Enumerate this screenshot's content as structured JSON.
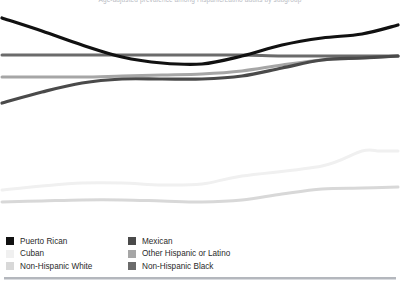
{
  "header": {
    "title_clipped": "Age-adjusted prevalence among Hispanic/Latino adults by subgroup"
  },
  "legend": {
    "columns": [
      {
        "items": [
          {
            "label": "Puerto Rican",
            "color": "#111111",
            "swatch_name": "legend-swatch-puerto-rican"
          },
          {
            "label": "Cuban",
            "color": "#f0f0f0",
            "swatch_name": "legend-swatch-cuban"
          },
          {
            "label": "Non-Hispanic White",
            "color": "#d8d8d8",
            "swatch_name": "legend-swatch-non-hispanic-white"
          }
        ]
      },
      {
        "items": [
          {
            "label": "Mexican",
            "color": "#4a4a4a",
            "swatch_name": "legend-swatch-mexican"
          },
          {
            "label": "Other Hispanic or Latino",
            "color": "#a6a6a6",
            "swatch_name": "legend-swatch-other-hispanic-or-latino"
          },
          {
            "label": "Non-Hispanic Black",
            "color": "#6b6b6b",
            "swatch_name": "legend-swatch-non-hispanic-black"
          }
        ]
      }
    ]
  },
  "chart_data": {
    "type": "line",
    "title": "Age-adjusted prevalence among Hispanic/Latino adults by subgroup",
    "xlabel": "",
    "ylabel": "",
    "grid": false,
    "legend_position": "bottom-left",
    "axes_visible": false,
    "x": [
      0,
      1,
      2,
      3,
      4,
      5,
      6,
      7,
      8,
      9,
      10
    ],
    "xlim": [
      0,
      10
    ],
    "ylim": [
      0,
      100
    ],
    "series": [
      {
        "name": "Puerto Rican",
        "color": "#111111",
        "width": 3.2,
        "values": [
          93.8,
          88.0,
          81.7,
          76.3,
          73.7,
          73.4,
          76.8,
          81.7,
          84.8,
          86.6,
          90.6
        ],
        "points_px": [
          [
            2,
            14
          ],
          [
            42,
            27
          ],
          [
            82,
            41
          ],
          [
            122,
            53
          ],
          [
            162,
            59
          ],
          [
            202,
            60
          ],
          [
            242,
            52
          ],
          [
            282,
            41
          ],
          [
            322,
            34
          ],
          [
            362,
            30
          ],
          [
            398,
            21
          ]
        ]
      },
      {
        "name": "Mexican",
        "color": "#4a4a4a",
        "width": 3.2,
        "values": [
          56.3,
          61.2,
          65.2,
          67.0,
          67.0,
          67.0,
          68.3,
          71.9,
          75.4,
          76.3,
          77.2
        ],
        "points_px": [
          [
            2,
            99
          ],
          [
            42,
            88
          ],
          [
            82,
            79
          ],
          [
            122,
            75
          ],
          [
            162,
            75
          ],
          [
            202,
            75
          ],
          [
            242,
            72
          ],
          [
            282,
            64
          ],
          [
            322,
            56
          ],
          [
            362,
            54
          ],
          [
            398,
            52
          ]
        ]
      },
      {
        "name": "Other Hispanic or Latino",
        "color": "#a6a6a6",
        "width": 3.0,
        "values": [
          67.4,
          67.4,
          67.4,
          67.9,
          68.3,
          68.8,
          70.1,
          72.8,
          75.0,
          76.3,
          77.2
        ],
        "points_px": [
          [
            2,
            73
          ],
          [
            42,
            73
          ],
          [
            82,
            73
          ],
          [
            122,
            72
          ],
          [
            162,
            71
          ],
          [
            202,
            70
          ],
          [
            242,
            67
          ],
          [
            282,
            61
          ],
          [
            322,
            56
          ],
          [
            362,
            54
          ],
          [
            398,
            52
          ]
        ]
      },
      {
        "name": "Non-Hispanic Black",
        "color": "#6b6b6b",
        "width": 3.0,
        "values": [
          77.7,
          77.7,
          77.7,
          77.7,
          77.7,
          77.7,
          77.7,
          77.2,
          76.8,
          76.8,
          77.2
        ],
        "points_px": [
          [
            2,
            51
          ],
          [
            42,
            51
          ],
          [
            82,
            51
          ],
          [
            122,
            51
          ],
          [
            162,
            51
          ],
          [
            202,
            51
          ],
          [
            242,
            51
          ],
          [
            282,
            52
          ],
          [
            322,
            52
          ],
          [
            362,
            52
          ],
          [
            398,
            52
          ]
        ]
      },
      {
        "name": "Non-Hispanic White",
        "color": "#d8d8d8",
        "width": 3.0,
        "values": [
          47.8,
          48.2,
          48.7,
          48.7,
          48.2,
          47.8,
          48.7,
          51.3,
          53.6,
          54.0,
          54.5
        ],
        "points_px": [
          [
            2,
            198
          ],
          [
            42,
            197
          ],
          [
            82,
            196
          ],
          [
            122,
            196
          ],
          [
            162,
            197
          ],
          [
            202,
            198
          ],
          [
            242,
            196
          ],
          [
            282,
            190
          ],
          [
            322,
            185
          ],
          [
            362,
            184
          ],
          [
            398,
            183
          ]
        ]
      },
      {
        "name": "Cuban",
        "color": "#f0f0f0",
        "width": 3.0,
        "values": [
          53.1,
          54.9,
          56.3,
          56.3,
          55.4,
          55.8,
          59.4,
          64.3,
          66.1,
          66.1,
          66.1
        ],
        "points_px": [
          [
            2,
            186
          ],
          [
            42,
            182
          ],
          [
            82,
            179
          ],
          [
            122,
            179
          ],
          [
            162,
            181
          ],
          [
            202,
            180
          ],
          [
            242,
            172
          ],
          [
            322,
            162
          ],
          [
            362,
            147
          ],
          [
            380,
            147
          ],
          [
            398,
            147
          ]
        ]
      }
    ]
  }
}
